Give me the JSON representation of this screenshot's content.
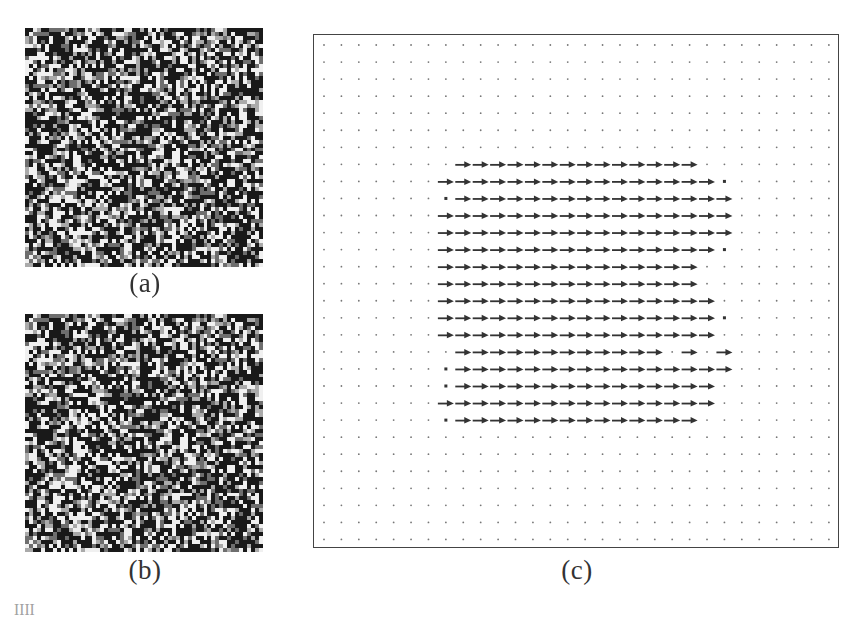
{
  "figure": {
    "panels": [
      {
        "id": "a",
        "label": "(a)",
        "kind": "random-dot-texture",
        "cells": 60,
        "seed": 1337
      },
      {
        "id": "b",
        "label": "(b)",
        "kind": "random-dot-texture",
        "cells": 60,
        "seed": 1337,
        "shifted_region": {
          "col_start": 7,
          "col_end": 23,
          "row_start": 7,
          "row_end": 22,
          "shift_cells": 1
        }
      },
      {
        "id": "c",
        "label": "(c)",
        "kind": "vector-field",
        "description": "Optical flow field: rightward arrows inside central region, dots elsewhere"
      }
    ],
    "caption_partial": "Fig. ... Random-dot ... (clipped caption line, only tops of glyphs visible)"
  },
  "chart_data": {
    "type": "quiver",
    "title": "(c)",
    "grid": {
      "cols": 30,
      "rows": 30
    },
    "default_marker": "dot",
    "arrow_direction": "right",
    "rows_with_arrows": [
      {
        "row": 7,
        "ticks": [],
        "segments": [
          [
            8,
            21
          ]
        ]
      },
      {
        "row": 8,
        "ticks": [],
        "segments": [
          [
            7,
            22
          ]
        ],
        "tick_right": 23
      },
      {
        "row": 9,
        "ticks": [
          7
        ],
        "segments": [
          [
            8,
            23
          ]
        ]
      },
      {
        "row": 10,
        "ticks": [],
        "segments": [
          [
            7,
            23
          ]
        ]
      },
      {
        "row": 11,
        "ticks": [],
        "segments": [
          [
            7,
            23
          ]
        ]
      },
      {
        "row": 12,
        "ticks": [],
        "segments": [
          [
            7,
            22
          ]
        ],
        "tick_right": 23
      },
      {
        "row": 13,
        "ticks": [],
        "segments": [
          [
            7,
            21
          ]
        ]
      },
      {
        "row": 14,
        "ticks": [],
        "segments": [
          [
            7,
            21
          ]
        ]
      },
      {
        "row": 15,
        "ticks": [],
        "segments": [
          [
            7,
            22
          ]
        ]
      },
      {
        "row": 16,
        "ticks": [],
        "segments": [
          [
            7,
            22
          ]
        ],
        "tick_right": 23
      },
      {
        "row": 17,
        "ticks": [],
        "segments": [
          [
            7,
            22
          ]
        ]
      },
      {
        "row": 18,
        "ticks": [],
        "segments": [
          [
            8,
            19
          ],
          [
            21,
            21
          ],
          [
            23,
            23
          ]
        ]
      },
      {
        "row": 19,
        "ticks": [
          7
        ],
        "segments": [
          [
            8,
            23
          ]
        ]
      },
      {
        "row": 20,
        "ticks": [
          7
        ],
        "segments": [
          [
            8,
            22
          ]
        ]
      },
      {
        "row": 21,
        "ticks": [],
        "segments": [
          [
            7,
            22
          ]
        ]
      },
      {
        "row": 22,
        "ticks": [
          7
        ],
        "segments": [
          [
            8,
            21
          ]
        ]
      }
    ],
    "xlabel": "",
    "ylabel": "",
    "legend": []
  }
}
